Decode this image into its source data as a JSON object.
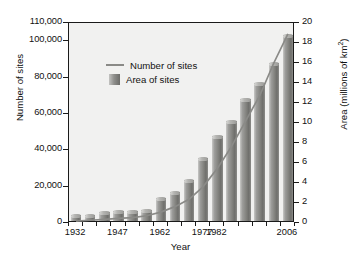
{
  "chart_data": {
    "type": "bar",
    "title": "",
    "subtitle": "",
    "xlabel": "Year",
    "ylabel": "Number of sites",
    "y2label": "Area (millions of km²)",
    "grid": false,
    "legend_position": "upper-left",
    "ylim": [
      0,
      110000
    ],
    "y2lim": [
      0,
      20
    ],
    "ytick_labels": [
      "0",
      "20,000",
      "40,000",
      "60,000",
      "80,000",
      "100,000",
      "110,000"
    ],
    "ytick_values": [
      0,
      20000,
      40000,
      60000,
      80000,
      100000,
      110000
    ],
    "y2tick_labels": [
      "0",
      "2",
      "4",
      "6",
      "8",
      "10",
      "12",
      "14",
      "16",
      "18",
      "20"
    ],
    "y2tick_values": [
      0,
      2,
      4,
      6,
      8,
      10,
      12,
      14,
      16,
      18,
      20
    ],
    "xtick_labels": [
      "1932",
      "1947",
      "1962",
      "1977",
      "1982",
      "2006"
    ],
    "xtick_values": [
      1932,
      1947,
      1962,
      1977,
      1982,
      2006
    ],
    "categories": [
      1932,
      1937,
      1942,
      1947,
      1952,
      1957,
      1962,
      1967,
      1972,
      1977,
      1980,
      1985,
      1990,
      1995,
      2000,
      2006
    ],
    "series": [
      {
        "name": "Area of sites",
        "type": "bar",
        "axis": "right",
        "unit": "millions of km²",
        "values": [
          0.6,
          0.6,
          0.9,
          1.0,
          1.0,
          1.1,
          2.3,
          2.9,
          4.1,
          6.3,
          8.5,
          10.0,
          12.2,
          13.8,
          15.8,
          18.6
        ]
      },
      {
        "name": "Number of sites",
        "type": "line",
        "axis": "left",
        "unit": "sites",
        "values": [
          1000,
          1500,
          2000,
          2500,
          3000,
          4000,
          6000,
          9000,
          13000,
          20000,
          30000,
          42000,
          56000,
          70000,
          88000,
          104000
        ]
      }
    ],
    "legend": [
      {
        "label": "Number of sites",
        "marker": "line",
        "color": "#8a8a87"
      },
      {
        "label": "Area of sites",
        "marker": "bar",
        "color": "#8f8f8c"
      }
    ],
    "colors": {
      "plot_background": "#f1f1f0",
      "axis": "#1a1a1a",
      "bar": "#8f8f8c",
      "line": "#8a8a87",
      "text": "#111111"
    }
  }
}
